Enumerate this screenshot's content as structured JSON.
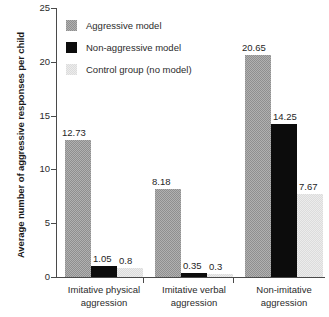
{
  "chart_data": {
    "type": "bar",
    "title": "",
    "xlabel": "",
    "ylabel": "Average number of aggressive responses per child",
    "ylim": [
      0,
      25
    ],
    "yticks": [
      0,
      5,
      10,
      15,
      20,
      25
    ],
    "grid": false,
    "legend_position": "top-left",
    "categories": [
      "Imitative physical aggression",
      "Imitative verbal aggression",
      "Non-imitative aggression"
    ],
    "category_lines": [
      [
        "Imitative physical",
        "aggression"
      ],
      [
        "Imitative verbal",
        "aggression"
      ],
      [
        "Non-imitative",
        "aggression"
      ]
    ],
    "series": [
      {
        "name": "Aggressive model",
        "color": "#8f8f8f",
        "values": [
          12.73,
          8.18,
          20.65
        ],
        "labels": [
          "12.73",
          "8.18",
          "20.65"
        ]
      },
      {
        "name": "Non-aggressive model",
        "color": "#0c0c0c",
        "values": [
          1.05,
          0.35,
          14.25
        ],
        "labels": [
          "1.05",
          "0.35",
          "14.25"
        ]
      },
      {
        "name": "Control group (no model)",
        "color": "#dcdcdc",
        "values": [
          0.8,
          0.3,
          7.67
        ],
        "labels": [
          "0.8",
          "0.3",
          "7.67"
        ]
      }
    ]
  },
  "yaxis": {
    "title": "Average number of aggressive responses per child",
    "ticks": [
      "25",
      "20",
      "15",
      "10",
      "5",
      "0"
    ]
  },
  "legend": {
    "items": [
      {
        "label": "Aggressive model",
        "swatch": "aggressive"
      },
      {
        "label": "Non-aggressive model",
        "swatch": "nonaggressive"
      },
      {
        "label": "Control group (no model)",
        "swatch": "control"
      }
    ]
  }
}
